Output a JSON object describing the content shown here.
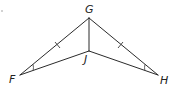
{
  "diagram": {
    "points": {
      "G": {
        "label": "G"
      },
      "F": {
        "label": "F"
      },
      "H": {
        "label": "H"
      },
      "J": {
        "label": "J"
      }
    },
    "segments": [
      {
        "name": "FG",
        "from": "F",
        "to": "G",
        "tick_marks": 1
      },
      {
        "name": "GH",
        "from": "G",
        "to": "H",
        "tick_marks": 1
      },
      {
        "name": "GJ",
        "from": "G",
        "to": "J",
        "tick_marks": 0
      },
      {
        "name": "FJ",
        "from": "F",
        "to": "J",
        "tick_marks": 0
      },
      {
        "name": "JH",
        "from": "J",
        "to": "H",
        "tick_marks": 0
      }
    ],
    "angle_marks": [
      {
        "vertex": "F",
        "arcs": 1
      },
      {
        "vertex": "H",
        "arcs": 1
      }
    ],
    "colors": {
      "stroke": "#2b2b2b",
      "label": "#222222",
      "background": "#ffffff"
    }
  }
}
